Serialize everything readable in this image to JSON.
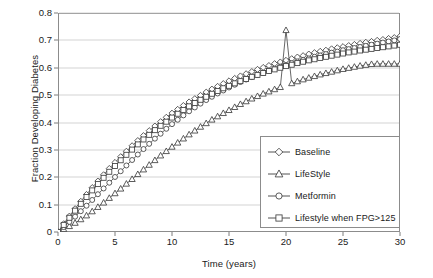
{
  "chart_data": {
    "type": "line",
    "title": "",
    "xlabel": "Time (years)",
    "ylabel": "Fraction Developing Diabetes",
    "xlim": [
      0,
      30
    ],
    "ylim": [
      0,
      0.8
    ],
    "xticks": [
      "0",
      "5",
      "10",
      "15",
      "20",
      "25",
      "30"
    ],
    "yticks": [
      "0",
      "0.1",
      "0.2",
      "0.3",
      "0.4",
      "0.5",
      "0.6",
      "0.7",
      "0.8"
    ],
    "grid": "horizontal",
    "legend_position": "lower-right-inside",
    "line_color": "#404040",
    "marker_fill": "#ffffff",
    "marker_edge": "#404040",
    "x": [
      0,
      0.5,
      1,
      1.5,
      2,
      2.5,
      3,
      3.5,
      4,
      4.5,
      5,
      5.5,
      6,
      6.5,
      7,
      7.5,
      8,
      8.5,
      9,
      9.5,
      10,
      10.5,
      11,
      11.5,
      12,
      12.5,
      13,
      13.5,
      14,
      14.5,
      15,
      15.5,
      16,
      16.5,
      17,
      17.5,
      18,
      18.5,
      19,
      19.5,
      20,
      20.5,
      21,
      21.5,
      22,
      22.5,
      23,
      23.5,
      24,
      24.5,
      25,
      25.5,
      26,
      26.5,
      27,
      27.5,
      28,
      28.5,
      29,
      29.5,
      30
    ],
    "series": [
      {
        "name": "Baseline",
        "marker": "diamond",
        "values": [
          0.0,
          0.03,
          0.058,
          0.085,
          0.112,
          0.137,
          0.162,
          0.186,
          0.209,
          0.232,
          0.254,
          0.275,
          0.295,
          0.315,
          0.334,
          0.352,
          0.37,
          0.387,
          0.403,
          0.419,
          0.434,
          0.448,
          0.462,
          0.475,
          0.487,
          0.499,
          0.511,
          0.522,
          0.532,
          0.542,
          0.552,
          0.561,
          0.57,
          0.578,
          0.586,
          0.594,
          0.601,
          0.608,
          0.615,
          0.621,
          0.627,
          0.633,
          0.639,
          0.644,
          0.65,
          0.655,
          0.66,
          0.664,
          0.669,
          0.673,
          0.677,
          0.681,
          0.685,
          0.689,
          0.693,
          0.696,
          0.7,
          0.703,
          0.707,
          0.71,
          0.715
        ]
      },
      {
        "name": "LifeStyle",
        "marker": "triangle",
        "values": [
          0.0,
          0.01,
          0.021,
          0.033,
          0.046,
          0.06,
          0.075,
          0.091,
          0.107,
          0.124,
          0.141,
          0.158,
          0.176,
          0.193,
          0.211,
          0.228,
          0.245,
          0.262,
          0.279,
          0.295,
          0.311,
          0.326,
          0.341,
          0.356,
          0.37,
          0.384,
          0.397,
          0.41,
          0.422,
          0.434,
          0.445,
          0.456,
          0.467,
          0.477,
          0.487,
          0.496,
          0.505,
          0.513,
          0.521,
          0.529,
          0.737,
          0.543,
          0.55,
          0.557,
          0.563,
          0.569,
          0.575,
          0.58,
          0.585,
          0.59,
          0.595,
          0.599,
          0.603,
          0.607,
          0.61,
          0.613,
          0.614,
          0.614,
          0.614,
          0.614,
          0.614
        ]
      },
      {
        "name": "Metformin",
        "marker": "circle",
        "values": [
          0.0,
          0.018,
          0.037,
          0.056,
          0.076,
          0.096,
          0.117,
          0.138,
          0.159,
          0.18,
          0.201,
          0.222,
          0.243,
          0.263,
          0.283,
          0.303,
          0.322,
          0.341,
          0.359,
          0.377,
          0.394,
          0.41,
          0.426,
          0.441,
          0.455,
          0.469,
          0.482,
          0.494,
          0.506,
          0.517,
          0.528,
          0.538,
          0.548,
          0.557,
          0.566,
          0.574,
          0.582,
          0.59,
          0.597,
          0.604,
          0.61,
          0.617,
          0.623,
          0.629,
          0.634,
          0.64,
          0.645,
          0.65,
          0.655,
          0.659,
          0.664,
          0.668,
          0.672,
          0.676,
          0.68,
          0.684,
          0.688,
          0.692,
          0.696,
          0.7,
          0.705
        ]
      },
      {
        "name": "Lifestyle when FPG>125",
        "marker": "square",
        "values": [
          0.0,
          0.026,
          0.052,
          0.078,
          0.103,
          0.128,
          0.152,
          0.175,
          0.198,
          0.22,
          0.241,
          0.262,
          0.282,
          0.301,
          0.32,
          0.338,
          0.355,
          0.372,
          0.388,
          0.403,
          0.418,
          0.432,
          0.446,
          0.459,
          0.471,
          0.483,
          0.494,
          0.505,
          0.515,
          0.525,
          0.534,
          0.543,
          0.551,
          0.559,
          0.567,
          0.574,
          0.581,
          0.588,
          0.594,
          0.6,
          0.606,
          0.611,
          0.617,
          0.622,
          0.627,
          0.631,
          0.636,
          0.64,
          0.644,
          0.648,
          0.652,
          0.656,
          0.659,
          0.663,
          0.666,
          0.669,
          0.672,
          0.675,
          0.678,
          0.681,
          0.684
        ]
      }
    ]
  }
}
